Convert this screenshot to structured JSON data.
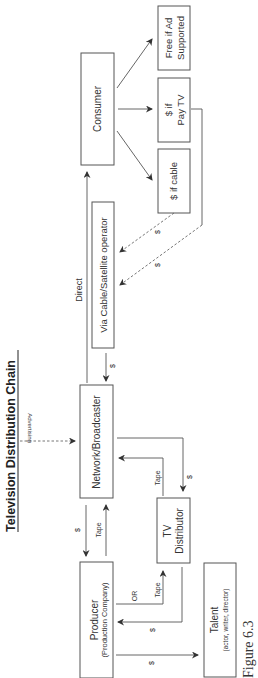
{
  "title": "Television Distribution Chain",
  "figure_label": "Figure 6.3",
  "nodes": {
    "producer": {
      "line1": "Producer",
      "line2": "(Production Company)"
    },
    "talent": {
      "line1": "Talent",
      "line2": "(actor, writer, director)"
    },
    "tv_distributor": {
      "line1": "TV",
      "line2": "Distributor"
    },
    "network": {
      "label": "Network/Broadcaster"
    },
    "via_cable": {
      "label": "Via Cable/Satellite operator"
    },
    "consumer": {
      "label": "Consumer"
    },
    "cable_pay": {
      "label": "$ if cable"
    },
    "paytv_pay": {
      "line1": "$ if",
      "line2": "Pay TV"
    },
    "free_ad": {
      "line1": "Free if Ad",
      "line2": "Supported"
    }
  },
  "edge_labels": {
    "producer_to_network_tape": "Tape",
    "network_to_producer_money": "$",
    "producer_to_distributor_or": "OR",
    "producer_to_distributor_tape": "Tape",
    "distributor_to_producer_money": "$",
    "producer_to_talent_money": "$",
    "distributor_to_network_tape": "Tape",
    "network_to_distributor_money": "$",
    "advertising": "Advertising",
    "direct": "Direct",
    "cable_to_network_money": "$",
    "cable_consumer_money": "$",
    "paytv_consumer_money": "$"
  },
  "colors": {
    "stroke": "#555555",
    "text": "#333333",
    "background": "#ffffff"
  }
}
